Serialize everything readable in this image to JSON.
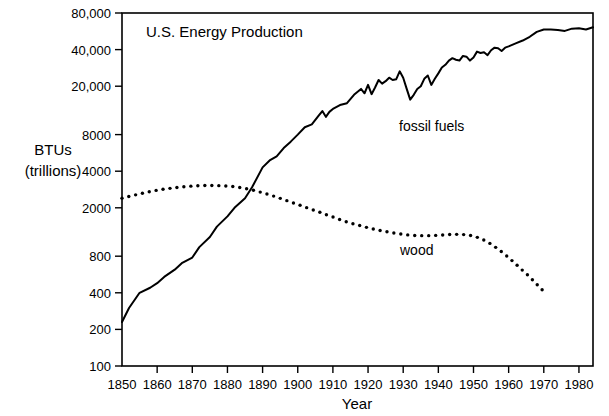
{
  "chart_data": {
    "type": "line",
    "title": "U.S. Energy Production",
    "xlabel": "Year",
    "ylabel": "BTUs\n(trillions)",
    "ylabel_line1": "BTUs",
    "ylabel_line2": "(trillions)",
    "yscale": "log",
    "ylim": [
      100,
      80000
    ],
    "xlim": [
      1850,
      1984
    ],
    "grid": false,
    "legend_position": "inline-annotation",
    "ytick_labels": [
      "100",
      "200",
      "400",
      "800",
      "2000",
      "4000",
      "8000",
      "20,000",
      "40,000",
      "80,000"
    ],
    "ytick_values": [
      100,
      200,
      400,
      800,
      2000,
      4000,
      8000,
      20000,
      40000,
      80000
    ],
    "xtick_labels": [
      "1850",
      "1860",
      "1870",
      "1880",
      "1890",
      "1900",
      "1910",
      "1920",
      "1930",
      "1940",
      "1950",
      "1960",
      "1970",
      "1980"
    ],
    "xtick_values": [
      1850,
      1860,
      1870,
      1880,
      1890,
      1900,
      1910,
      1920,
      1930,
      1940,
      1950,
      1960,
      1970,
      1980
    ],
    "annotations": [
      {
        "text": "fossil fuels",
        "x": 1933,
        "y": 11000
      },
      {
        "text": "wood",
        "x": 1938,
        "y": 950
      }
    ],
    "series": [
      {
        "name": "fossil fuels",
        "style": "solid-line",
        "color": "#000000",
        "x": [
          1850,
          1852,
          1855,
          1858,
          1860,
          1862,
          1865,
          1867,
          1870,
          1872,
          1875,
          1877,
          1880,
          1882,
          1885,
          1887,
          1890,
          1892,
          1894,
          1896,
          1898,
          1900,
          1902,
          1904,
          1906,
          1907,
          1908,
          1909,
          1910,
          1912,
          1914,
          1916,
          1918,
          1919,
          1920,
          1921,
          1922,
          1923,
          1924,
          1925,
          1926,
          1927,
          1928,
          1929,
          1930,
          1931,
          1932,
          1933,
          1934,
          1935,
          1936,
          1937,
          1938,
          1939,
          1940,
          1941,
          1942,
          1943,
          1944,
          1945,
          1946,
          1947,
          1948,
          1949,
          1950,
          1951,
          1952,
          1953,
          1954,
          1955,
          1956,
          1957,
          1958,
          1959,
          1960,
          1962,
          1964,
          1966,
          1968,
          1970,
          1972,
          1974,
          1976,
          1978,
          1980,
          1982,
          1984
        ],
        "values": [
          230,
          300,
          400,
          440,
          480,
          540,
          620,
          700,
          780,
          950,
          1150,
          1400,
          1700,
          2000,
          2400,
          2950,
          4300,
          4900,
          5300,
          6200,
          7000,
          8000,
          9200,
          9700,
          11500,
          12500,
          11200,
          12300,
          13000,
          14000,
          14500,
          17000,
          19000,
          17500,
          20500,
          17200,
          19500,
          22500,
          21000,
          22000,
          23500,
          22500,
          22800,
          26500,
          23500,
          19000,
          15500,
          17000,
          19000,
          20000,
          23000,
          24500,
          20500,
          23000,
          25500,
          28500,
          30000,
          32500,
          34000,
          33000,
          32500,
          35500,
          35000,
          32500,
          34500,
          38500,
          37500,
          38000,
          36000,
          39500,
          41500,
          41000,
          39000,
          41500,
          42500,
          45000,
          47500,
          51000,
          56000,
          58500,
          58500,
          58000,
          57000,
          59500,
          60000,
          58500,
          61000
        ]
      },
      {
        "name": "wood",
        "style": "dotted",
        "color": "#000000",
        "x": [
          1850,
          1852,
          1854,
          1856,
          1858,
          1860,
          1862,
          1864,
          1866,
          1868,
          1870,
          1872,
          1874,
          1876,
          1878,
          1880,
          1882,
          1884,
          1886,
          1888,
          1890,
          1892,
          1894,
          1896,
          1898,
          1900,
          1902,
          1904,
          1906,
          1908,
          1910,
          1912,
          1914,
          1916,
          1918,
          1920,
          1922,
          1924,
          1926,
          1928,
          1930,
          1932,
          1934,
          1936,
          1938,
          1940,
          1942,
          1944,
          1946,
          1948,
          1950,
          1952,
          1954,
          1956,
          1958,
          1960,
          1962,
          1964,
          1966,
          1968,
          1970
        ],
        "values": [
          2400,
          2480,
          2560,
          2640,
          2720,
          2790,
          2850,
          2900,
          2950,
          2990,
          3020,
          3040,
          3050,
          3050,
          3040,
          3020,
          2980,
          2920,
          2850,
          2760,
          2660,
          2560,
          2450,
          2340,
          2230,
          2130,
          2030,
          1940,
          1850,
          1760,
          1680,
          1600,
          1530,
          1470,
          1420,
          1370,
          1330,
          1290,
          1260,
          1230,
          1210,
          1190,
          1180,
          1180,
          1180,
          1190,
          1200,
          1210,
          1210,
          1200,
          1170,
          1120,
          1050,
          960,
          870,
          780,
          690,
          610,
          540,
          470,
          410
        ]
      }
    ]
  },
  "figure": {
    "plot_area": {
      "left": 122,
      "top": 13,
      "right": 593,
      "bottom": 366
    }
  }
}
